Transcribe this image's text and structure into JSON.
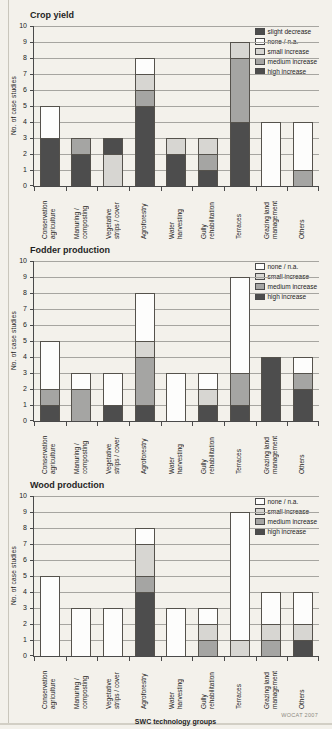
{
  "page": {
    "background": "#f3f1eb",
    "footer": {
      "xlabel": "SWC technology groups",
      "source": "WOCAT 2007"
    }
  },
  "colors": {
    "slight decrease": "#4d4d4d",
    "none / n.a.": "#fdfdfc",
    "small increase": "#d7d6d2",
    "medium increase": "#a5a5a3",
    "high increase": "#4d4d4d",
    "grid": "#a6a5a0",
    "axis": "#4a4a4a",
    "bar_border": "#55524c"
  },
  "chart_data": [
    {
      "type": "bar",
      "stacked": true,
      "title": "Crop yield",
      "ylabel": "No. of case studies",
      "xlabel": "",
      "ylim": [
        0,
        10
      ],
      "ytick_step": 1,
      "grid": true,
      "legend_position": "top-right",
      "legend_order": [
        "slight decrease",
        "none / n.a.",
        "small increase",
        "medium increase",
        "high increase"
      ],
      "categories": [
        "Conservation\nagriculture",
        "Manuring /\ncomposting",
        "Vegetative\nstrips / cover",
        "Agroforestry",
        "Water\nharvesting",
        "Gully\nrehabilitation",
        "Terraces",
        "Grazing land\nmanagement",
        "Others"
      ],
      "series": [
        {
          "name": "high increase",
          "values": [
            3,
            2,
            0,
            5,
            2,
            1,
            4,
            0,
            0
          ]
        },
        {
          "name": "medium increase",
          "values": [
            0,
            1,
            0,
            1,
            0,
            1,
            4,
            0,
            1
          ]
        },
        {
          "name": "small increase",
          "values": [
            0,
            0,
            2,
            1,
            1,
            1,
            1,
            0,
            0
          ]
        },
        {
          "name": "none / n.a.",
          "values": [
            2,
            0,
            0,
            1,
            0,
            0,
            0,
            4,
            3
          ]
        },
        {
          "name": "slight decrease",
          "values": [
            0,
            0,
            1,
            0,
            0,
            0,
            0,
            0,
            0
          ]
        }
      ]
    },
    {
      "type": "bar",
      "stacked": true,
      "title": "Fodder production",
      "ylabel": "No. of case studies",
      "xlabel": "",
      "ylim": [
        0,
        10
      ],
      "ytick_step": 1,
      "grid": true,
      "legend_position": "top-right",
      "legend_order": [
        "none / n.a.",
        "small increase",
        "medium increase",
        "high increase"
      ],
      "categories": [
        "Conservation\nagriculture",
        "Manuring /\ncomposting",
        "Vegetative\nstrips / cover",
        "Agroforestry",
        "Water\nharvesting",
        "Gully\nrehabilitation",
        "Terraces",
        "Grazing land\nmanagement",
        "Others"
      ],
      "series": [
        {
          "name": "high increase",
          "values": [
            1,
            0,
            1,
            1,
            0,
            1,
            1,
            4,
            2
          ]
        },
        {
          "name": "medium increase",
          "values": [
            1,
            2,
            0,
            3,
            0,
            0,
            2,
            0,
            1
          ]
        },
        {
          "name": "small increase",
          "values": [
            0,
            0,
            0,
            1,
            0,
            1,
            0,
            0,
            0
          ]
        },
        {
          "name": "none / n.a.",
          "values": [
            3,
            1,
            2,
            3,
            3,
            1,
            6,
            0,
            1
          ]
        }
      ]
    },
    {
      "type": "bar",
      "stacked": true,
      "title": "Wood production",
      "ylabel": "No. of case studies",
      "xlabel": "SWC technology groups",
      "ylim": [
        0,
        10
      ],
      "ytick_step": 1,
      "grid": true,
      "legend_position": "top-right",
      "legend_order": [
        "none / n.a.",
        "small increase",
        "medium increase",
        "high increase"
      ],
      "categories": [
        "Conservation\nagriculture",
        "Manuring /\ncomposting",
        "Vegetative\nstrips / cover",
        "Agroforestry",
        "Water\nharvesting",
        "Gully\nrehabilitation",
        "Terraces",
        "Grazing land\nmanagement",
        "Others"
      ],
      "series": [
        {
          "name": "high increase",
          "values": [
            0,
            0,
            0,
            4,
            0,
            0,
            0,
            0,
            1
          ]
        },
        {
          "name": "medium increase",
          "values": [
            0,
            0,
            0,
            1,
            0,
            1,
            0,
            1,
            0
          ]
        },
        {
          "name": "small increase",
          "values": [
            0,
            0,
            0,
            2,
            0,
            1,
            1,
            1,
            1
          ]
        },
        {
          "name": "none / n.a.",
          "values": [
            5,
            3,
            3,
            1,
            3,
            1,
            8,
            2,
            2
          ]
        }
      ]
    }
  ]
}
